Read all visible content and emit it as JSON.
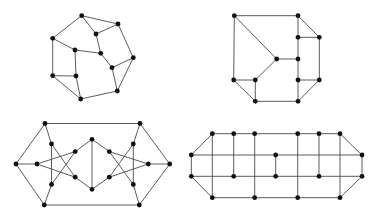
{
  "colors": {
    "background": "#ffffff",
    "edge": "#4a4a4a",
    "node": "#111111"
  },
  "node_radius": 2.4,
  "graphs": [
    {
      "id": "graph-1",
      "nodes": {
        "A": [
          81.7,
          15.7
        ],
        "B": [
          118,
          24
        ],
        "C": [
          96,
          34
        ],
        "D": [
          52.7,
          38.3
        ],
        "E": [
          75,
          50
        ],
        "F": [
          100.7,
          53.3
        ],
        "G": [
          133.3,
          57.7
        ],
        "H": [
          112,
          67.7
        ],
        "I": [
          52.7,
          75.7
        ],
        "J": [
          76,
          76
        ],
        "K": [
          117.3,
          91
        ],
        "L": [
          80.7,
          99
        ]
      },
      "edges": [
        [
          "A",
          "B"
        ],
        [
          "A",
          "C"
        ],
        [
          "A",
          "D"
        ],
        [
          "B",
          "C"
        ],
        [
          "B",
          "G"
        ],
        [
          "C",
          "F"
        ],
        [
          "D",
          "E"
        ],
        [
          "D",
          "I"
        ],
        [
          "E",
          "F"
        ],
        [
          "E",
          "J"
        ],
        [
          "F",
          "H"
        ],
        [
          "G",
          "H"
        ],
        [
          "G",
          "K"
        ],
        [
          "H",
          "K"
        ],
        [
          "I",
          "J"
        ],
        [
          "I",
          "L"
        ],
        [
          "J",
          "L"
        ],
        [
          "L",
          "K"
        ]
      ]
    },
    {
      "id": "graph-2",
      "nodes": {
        "A": [
          234.3,
          15.7
        ],
        "B": [
          298,
          15.7
        ],
        "C": [
          298,
          37.3
        ],
        "D": [
          319.3,
          37.3
        ],
        "E": [
          276.7,
          59
        ],
        "F": [
          298,
          59
        ],
        "G": [
          233.7,
          80
        ],
        "H": [
          255.3,
          80
        ],
        "I": [
          298,
          80
        ],
        "J": [
          319.3,
          80
        ],
        "K": [
          255.3,
          101.3
        ],
        "L": [
          298,
          101.3
        ]
      },
      "edges": [
        [
          "A",
          "B"
        ],
        [
          "A",
          "G"
        ],
        [
          "A",
          "E"
        ],
        [
          "B",
          "C"
        ],
        [
          "B",
          "D"
        ],
        [
          "C",
          "D"
        ],
        [
          "C",
          "F"
        ],
        [
          "D",
          "J"
        ],
        [
          "E",
          "F"
        ],
        [
          "E",
          "H"
        ],
        [
          "F",
          "I"
        ],
        [
          "G",
          "H"
        ],
        [
          "G",
          "K"
        ],
        [
          "H",
          "K"
        ],
        [
          "I",
          "J"
        ],
        [
          "I",
          "L"
        ],
        [
          "J",
          "L"
        ],
        [
          "K",
          "L"
        ]
      ]
    },
    {
      "id": "graph-3",
      "nodes": {
        "TL": [
          45,
          123.5
        ],
        "TR": [
          140,
          123.5
        ],
        "L": [
          16,
          164
        ],
        "R": [
          169.7,
          164
        ],
        "BL": [
          44.3,
          205
        ],
        "BR": [
          139.3,
          205
        ],
        "l1": [
          37,
          164
        ],
        "a": [
          51.5,
          144
        ],
        "b": [
          51.5,
          184.5
        ],
        "c": [
          75.2,
          151.6
        ],
        "d": [
          75.2,
          177.2
        ],
        "r1": [
          148.3,
          164
        ],
        "a2": [
          133.3,
          144
        ],
        "b2": [
          133.3,
          184.5
        ],
        "c2": [
          109.3,
          151.6
        ],
        "d2": [
          109.3,
          177.2
        ],
        "T": [
          92,
          139.3
        ],
        "Bm": [
          92,
          189.3
        ]
      },
      "edges": [
        [
          "TL",
          "TR"
        ],
        [
          "BL",
          "BR"
        ],
        [
          "TL",
          "L"
        ],
        [
          "L",
          "BL"
        ],
        [
          "TR",
          "R"
        ],
        [
          "R",
          "BR"
        ],
        [
          "TL",
          "a"
        ],
        [
          "BL",
          "b"
        ],
        [
          "L",
          "l1"
        ],
        [
          "TR",
          "a2"
        ],
        [
          "BR",
          "b2"
        ],
        [
          "R",
          "r1"
        ],
        [
          "a",
          "b"
        ],
        [
          "l1",
          "c"
        ],
        [
          "l1",
          "d"
        ],
        [
          "a",
          "d"
        ],
        [
          "b",
          "c"
        ],
        [
          "a2",
          "b2"
        ],
        [
          "r1",
          "c2"
        ],
        [
          "r1",
          "d2"
        ],
        [
          "a2",
          "d2"
        ],
        [
          "b2",
          "c2"
        ],
        [
          "c",
          "T"
        ],
        [
          "d",
          "Bm"
        ],
        [
          "c2",
          "T"
        ],
        [
          "d2",
          "Bm"
        ],
        [
          "T",
          "Bm"
        ]
      ]
    },
    {
      "id": "graph-4",
      "nodes": {
        "t1": [
          212.3,
          133.7
        ],
        "t2": [
          233.7,
          133.7
        ],
        "t3": [
          254.7,
          133.7
        ],
        "t4": [
          297.7,
          133.7
        ],
        "t5": [
          319,
          133.7
        ],
        "t6": [
          340,
          133.7
        ],
        "mL": [
          191.3,
          155
        ],
        "mC": [
          275.7,
          155
        ],
        "mR": [
          362,
          155
        ],
        "nL": [
          191.3,
          176.3
        ],
        "n2": [
          233.7,
          176.3
        ],
        "nC": [
          275.7,
          176.3
        ],
        "n5": [
          319,
          176.3
        ],
        "nR": [
          362,
          176.3
        ],
        "b1": [
          212.3,
          197.7
        ],
        "b3": [
          254.7,
          197.7
        ],
        "b4": [
          297.7,
          197.7
        ],
        "b6": [
          340,
          197.7
        ]
      },
      "edges": [
        [
          "t1",
          "t2"
        ],
        [
          "t2",
          "t3"
        ],
        [
          "t3",
          "t4"
        ],
        [
          "t4",
          "t5"
        ],
        [
          "t5",
          "t6"
        ],
        [
          "mL",
          "t1"
        ],
        [
          "t6",
          "mR"
        ],
        [
          "mL",
          "mC"
        ],
        [
          "mC",
          "mR"
        ],
        [
          "mL",
          "nL"
        ],
        [
          "mR",
          "nR"
        ],
        [
          "nL",
          "n2"
        ],
        [
          "n2",
          "nC"
        ],
        [
          "nC",
          "n5"
        ],
        [
          "n5",
          "nR"
        ],
        [
          "nL",
          "b1"
        ],
        [
          "nR",
          "b6"
        ],
        [
          "b1",
          "b3"
        ],
        [
          "b3",
          "b4"
        ],
        [
          "b4",
          "b6"
        ],
        [
          "t1",
          "b1"
        ],
        [
          "t2",
          "n2"
        ],
        [
          "t3",
          "b3"
        ],
        [
          "mC",
          "nC"
        ],
        [
          "t4",
          "b4"
        ],
        [
          "t5",
          "n5"
        ],
        [
          "t6",
          "b6"
        ]
      ]
    }
  ]
}
